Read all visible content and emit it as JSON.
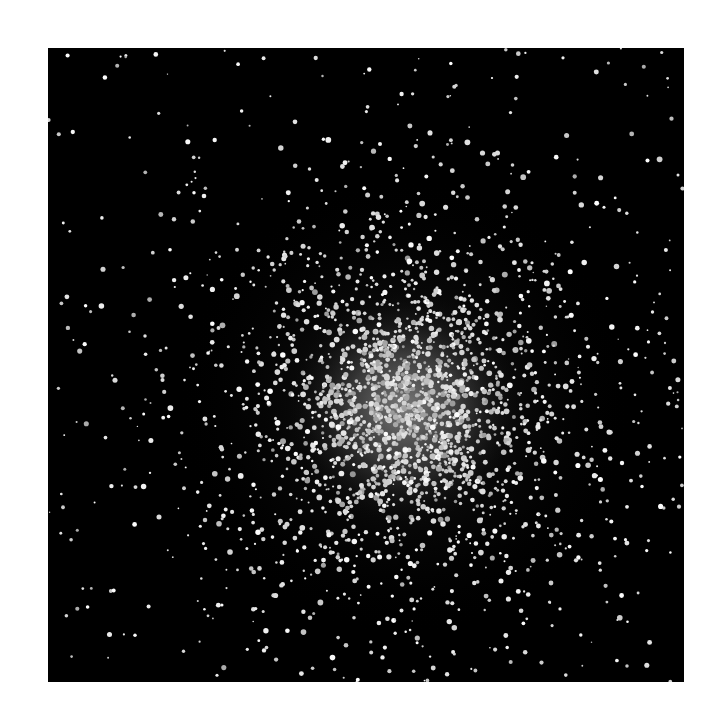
{
  "image": {
    "subject": "globular star cluster",
    "background_color": "#000000",
    "page_color": "#ffffff",
    "star_color": "#f2f2f2",
    "core_color": "#b8b8b8"
  }
}
